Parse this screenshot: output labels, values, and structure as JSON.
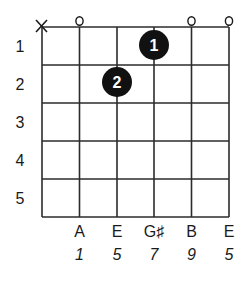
{
  "diagram": {
    "type": "guitar-chord-diagram",
    "strings": 6,
    "frets_shown": 5,
    "fret_numbers": [
      "1",
      "2",
      "3",
      "4",
      "5"
    ],
    "open_muted": [
      {
        "string": 1,
        "symbol": "X",
        "meaning": "muted"
      },
      {
        "string": 2,
        "symbol": "o",
        "meaning": "open"
      },
      {
        "string": 5,
        "symbol": "o",
        "meaning": "open"
      },
      {
        "string": 6,
        "symbol": "o",
        "meaning": "open"
      }
    ],
    "dots": [
      {
        "string": 4,
        "fret": 1,
        "finger": "1"
      },
      {
        "string": 3,
        "fret": 2,
        "finger": "2"
      }
    ],
    "note_names": [
      "A",
      "E",
      "G♯",
      "B",
      "E"
    ],
    "intervals": [
      "1",
      "5",
      "7",
      "9",
      "5"
    ],
    "colors": {
      "line": "#2b2b2b",
      "dot": "#111111",
      "dot_text": "#ffffff",
      "text": "#1a1a1a"
    }
  }
}
